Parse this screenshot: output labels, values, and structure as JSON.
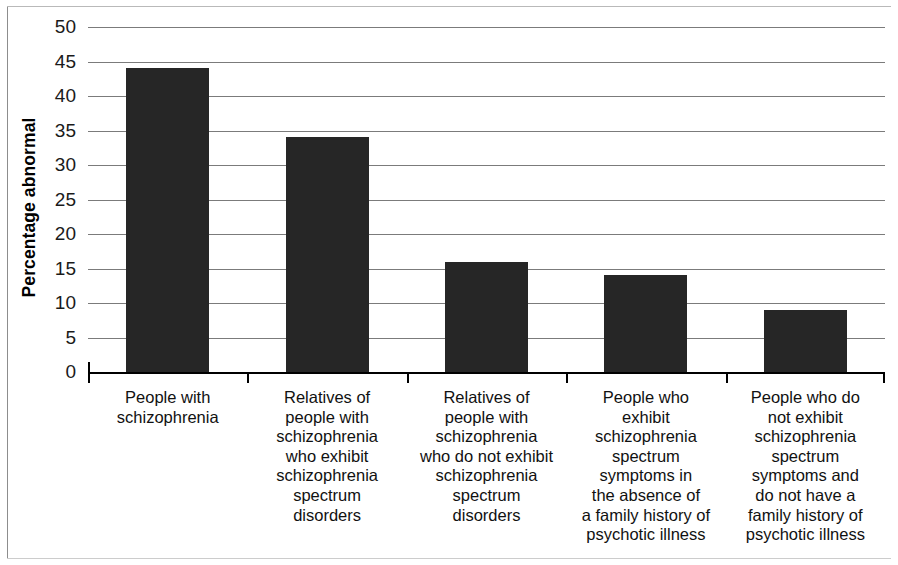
{
  "chart_data": {
    "type": "bar",
    "title": "",
    "subtitle": "",
    "xlabel": "",
    "ylabel": "Percentage abnormal",
    "ylim": [
      0,
      50
    ],
    "yticks": [
      0,
      5,
      10,
      15,
      20,
      25,
      30,
      35,
      40,
      45,
      50
    ],
    "ytick_labels": [
      "0",
      "5",
      "10",
      "15",
      "20",
      "25",
      "30",
      "35",
      "40",
      "45",
      "50"
    ],
    "grid": true,
    "legend": false,
    "bar_color": "#262626",
    "categories": [
      "People with schizophrenia",
      "Relatives of people with schizophrenia who exhibit schizophrenia spectrum disorders",
      "Relatives of people with schizophrenia who do not exhibit schizophrenia spectrum disorders",
      "People who exhibit schizophrenia spectrum symptoms in the absence of a family history of psychotic illness",
      "People who do not exhibit schizophrenia spectrum symptoms and do not have a family history of psychotic illness"
    ],
    "category_lines": [
      [
        "People with",
        "schizophrenia"
      ],
      [
        "Relatives of",
        "people with",
        "schizophrenia",
        "who exhibit",
        "schizophrenia",
        "spectrum",
        "disorders"
      ],
      [
        "Relatives of",
        "people with",
        "schizophrenia",
        "who do not exhibit",
        "schizophrenia",
        "spectrum",
        "disorders"
      ],
      [
        "People who",
        "exhibit",
        "schizophrenia",
        "spectrum",
        "symptoms in",
        "the absence of",
        "a family history of",
        "psychotic illness"
      ],
      [
        "People who do",
        "not exhibit",
        "schizophrenia",
        "spectrum",
        "symptoms and",
        "do not have a",
        "family history of",
        "psychotic illness"
      ]
    ],
    "values": [
      44,
      34,
      16,
      14,
      9
    ]
  }
}
